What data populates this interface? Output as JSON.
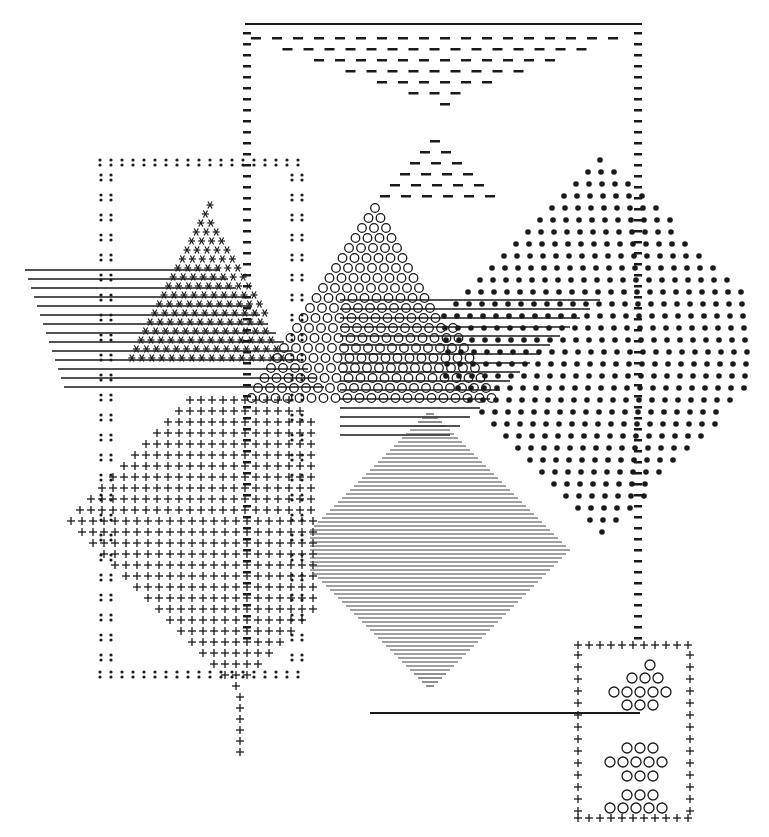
{
  "artwork": {
    "type": "typewriter-art",
    "description": "Abstract geometric composition typed with characters",
    "colors": {
      "ink": "#1a1a1a",
      "paper": "#ffffff",
      "gray": "#555555"
    },
    "glyphs": {
      "frame_top_right": "-",
      "frame_left": ":",
      "asterisk_triangle": "*",
      "circle_triangle": "o",
      "dot_diamond": "•",
      "plus_diamond": "+",
      "line_diamond": "—",
      "bottom_box": "+",
      "bottom_circles": "o"
    }
  }
}
